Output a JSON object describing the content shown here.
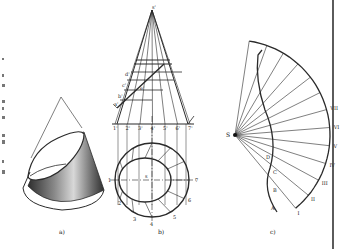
{
  "figure": {
    "panels": [
      {
        "id": "a",
        "caption": "a)",
        "description": "Pictorial view of a right circular cone truncated by an inclined plane"
      },
      {
        "id": "b",
        "caption": "b)",
        "description": "Front and top projections of the truncated cone"
      },
      {
        "id": "c",
        "caption": "c)",
        "description": "Development (unfolded surface) of the truncated cone"
      }
    ],
    "panel_b": {
      "apex_label": "s'",
      "section_labels": [
        "d'",
        "c'",
        "b'",
        "a'",
        "e'"
      ],
      "base_front_labels": [
        "1'",
        "2'",
        "3'",
        "4'",
        "5'",
        "6'",
        "7'"
      ],
      "plan_labels": [
        "1",
        "2",
        "3",
        "4",
        "5",
        "6",
        "7"
      ],
      "center_label": "s"
    },
    "panel_c": {
      "apex_label": "S",
      "curve_labels": [
        "A",
        "B",
        "C",
        "D"
      ],
      "roman_labels": [
        "I",
        "II",
        "III",
        "IV",
        "V",
        "VI",
        "VII"
      ]
    },
    "colors": {
      "line": "#2a2a2a",
      "cone_dark": "#3a3a3a",
      "cone_light": "#cfcfcf",
      "background": "#ffffff"
    }
  }
}
